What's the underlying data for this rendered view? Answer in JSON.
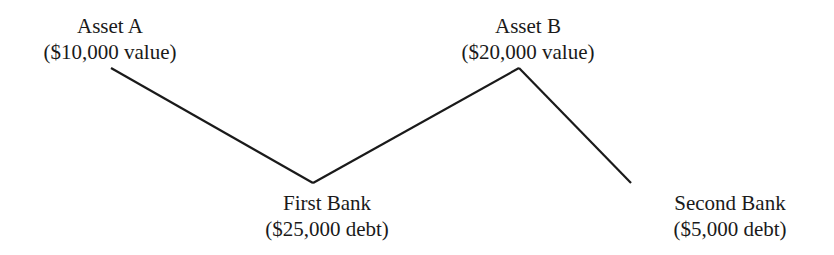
{
  "nodes": {
    "asset_a": {
      "name": "Asset A",
      "detail": "($10,000 value)"
    },
    "asset_b": {
      "name": "Asset B",
      "detail": "($20,000 value)"
    },
    "first_bank": {
      "name": "First Bank",
      "detail": "($25,000 debt)"
    },
    "second_bank": {
      "name": "Second Bank",
      "detail": "($5,000 debt)"
    }
  },
  "edges": [
    {
      "from": "Asset A",
      "to": "First Bank"
    },
    {
      "from": "Asset B",
      "to": "First Bank"
    },
    {
      "from": "Asset B",
      "to": "Second Bank"
    }
  ],
  "colors": {
    "line": "#1a1a1a",
    "background": "#ffffff"
  }
}
